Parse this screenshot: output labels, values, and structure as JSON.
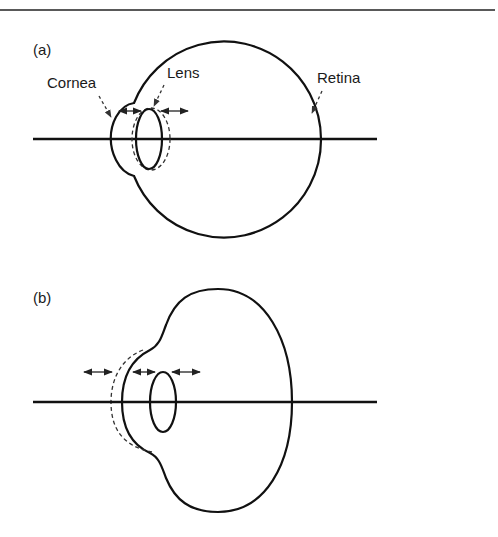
{
  "figure": {
    "panels": [
      {
        "id": "a",
        "label": "(a)",
        "annotations": {
          "cornea": "Cornea",
          "lens": "Lens",
          "retina": "Retina"
        }
      },
      {
        "id": "b",
        "label": "(b)"
      }
    ],
    "colors": {
      "line": "#111111",
      "background": "#ffffff"
    }
  }
}
